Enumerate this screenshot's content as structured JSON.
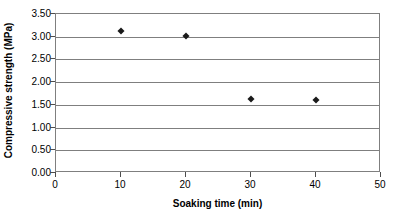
{
  "chart_data": {
    "type": "scatter",
    "title": "",
    "xlabel": "Soaking time (min)",
    "ylabel": "Compressive strength (MPa)",
    "xlim": [
      0,
      50
    ],
    "ylim": [
      0.0,
      3.5
    ],
    "xticks": [
      0,
      10,
      20,
      30,
      40,
      50
    ],
    "xtick_labels": [
      "0",
      "10",
      "20",
      "30",
      "40",
      "50"
    ],
    "yticks": [
      0.0,
      0.5,
      1.0,
      1.5,
      2.0,
      2.5,
      3.0,
      3.5
    ],
    "ytick_labels": [
      "0.00",
      "0.50",
      "1.00",
      "1.50",
      "2.00",
      "2.50",
      "3.00",
      "3.50"
    ],
    "grid": "horizontal",
    "legend": "none",
    "marker": "diamond",
    "marker_color": "#1a1a1a",
    "gridline_color": "#7f7f7f",
    "x": [
      10,
      20,
      30,
      40
    ],
    "y": [
      3.13,
      3.01,
      1.62,
      1.61
    ],
    "points": [
      {
        "x": 10,
        "y": 3.13
      },
      {
        "x": 20,
        "y": 3.01
      },
      {
        "x": 30,
        "y": 1.62
      },
      {
        "x": 40,
        "y": 1.61
      }
    ],
    "series": [
      {
        "name": "Compressive strength",
        "x": [
          10,
          20,
          30,
          40
        ],
        "values": [
          3.13,
          3.01,
          1.62,
          1.61
        ]
      }
    ]
  }
}
